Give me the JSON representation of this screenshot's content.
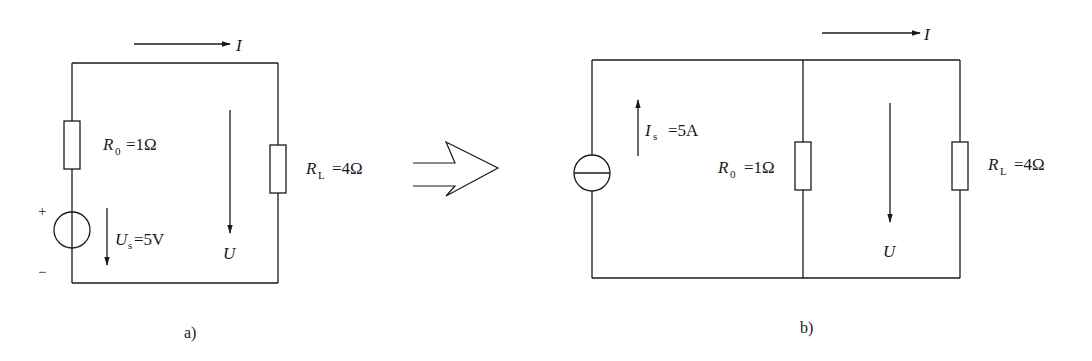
{
  "diagram": {
    "type": "circuit-equivalence",
    "transform_arrow": "hollow-right-arrow",
    "circuit_a": {
      "caption": "a)",
      "current_label": "I",
      "voltage_label": "U",
      "source": {
        "kind": "voltage-source",
        "symbol": "U",
        "subscript": "s",
        "value": "=5V",
        "plus": "+",
        "minus": "−"
      },
      "r0": {
        "symbol": "R",
        "subscript": "0",
        "value": "=1Ω"
      },
      "rl": {
        "symbol": "R",
        "subscript": "L",
        "value": "=4Ω"
      }
    },
    "circuit_b": {
      "caption": "b)",
      "current_label": "I",
      "voltage_label": "U",
      "source": {
        "kind": "current-source",
        "symbol": "I",
        "subscript": "s",
        "value": "=5A"
      },
      "r0": {
        "symbol": "R",
        "subscript": "0",
        "value": "=1Ω"
      },
      "rl": {
        "symbol": "R",
        "subscript": "L",
        "value": "=4Ω"
      }
    }
  }
}
